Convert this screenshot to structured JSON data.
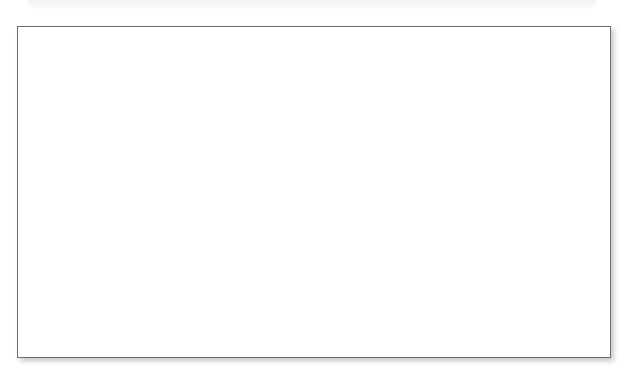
{
  "top_strip": {
    "text": ""
  },
  "figure": {
    "title": "",
    "stroke_color": "#6e6e6e",
    "dashed_color": "#9a9a9a",
    "text_color": "#111111",
    "background": "#ffffff"
  },
  "nodes": [
    {
      "id": "gp_m_left",
      "shape": "square",
      "label": "",
      "sub": "",
      "x": 81,
      "y": 65,
      "size": 32,
      "deceased": false
    },
    {
      "id": "gp_f_left",
      "shape": "circle",
      "label": "",
      "sub": "",
      "x": 256,
      "y": 64,
      "size": 32,
      "deceased": false
    },
    {
      "id": "aunt1",
      "shape": "circle",
      "label": "",
      "sub": "",
      "x": 116,
      "y": 136,
      "size": 32,
      "deceased": false
    },
    {
      "id": "aunt2",
      "shape": "circle",
      "label": "",
      "sub": "",
      "x": 158,
      "y": 136,
      "size": 32,
      "deceased": false
    },
    {
      "id": "aunt3",
      "shape": "circle",
      "label": "",
      "sub": "",
      "x": 208,
      "y": 136,
      "size": 32,
      "deceased": false
    },
    {
      "id": "partner_left",
      "shape": "square",
      "label": "",
      "sub": "",
      "x": 260,
      "y": 133,
      "size": 32,
      "deceased": false
    },
    {
      "id": "cousin_left",
      "shape": "circle",
      "label": "",
      "sub": "",
      "x": 244,
      "y": 195,
      "size": 32,
      "deceased": false
    },
    {
      "id": "gp_m_right",
      "shape": "square",
      "label": "",
      "sub": "",
      "x": 378,
      "y": 61,
      "size": 32,
      "deceased": true
    },
    {
      "id": "gp_f_right",
      "shape": "circle",
      "label": "",
      "sub": "",
      "x": 475,
      "y": 62,
      "size": 32,
      "deceased": false
    },
    {
      "id": "partner_right",
      "shape": "square",
      "label": "",
      "sub": "",
      "x": 351,
      "y": 128,
      "size": 32,
      "deceased": false
    },
    {
      "id": "aunt_right",
      "shape": "circle",
      "label": "",
      "sub": "",
      "x": 418,
      "y": 128,
      "size": 32,
      "deceased": false
    },
    {
      "id": "cousin_r_m",
      "shape": "square",
      "label": "",
      "sub": "",
      "x": 357,
      "y": 191,
      "size": 32,
      "deceased": false
    },
    {
      "id": "cousin_r_f",
      "shape": "circle",
      "label": "",
      "sub": "",
      "x": 411,
      "y": 191,
      "size": 32,
      "deceased": false
    },
    {
      "id": "bobby",
      "shape": "square",
      "label": "Bobby",
      "sub": "36",
      "x": 85,
      "y": 249,
      "size": 44,
      "deceased": false
    },
    {
      "id": "vivian",
      "shape": "circle",
      "label": "Vivian",
      "sub": "36",
      "x": 468,
      "y": 249,
      "size": 44,
      "deceased": false
    },
    {
      "id": "marcie",
      "shape": "circle",
      "label": "Marcie",
      "sub": "12",
      "x": 215,
      "y": 323,
      "size": 44,
      "deceased": false
    },
    {
      "id": "caleb",
      "shape": "square",
      "label": "Caleb",
      "sub": "3",
      "x": 346,
      "y": 320,
      "size": 44,
      "deceased": false
    }
  ],
  "annotations": [
    {
      "id": "annot-right",
      "lines": [
        "Moved into",
        "Bobby and",
        "Vivian's house."
      ],
      "x": 492,
      "y": 76,
      "align": "left"
    },
    {
      "id": "annot-left",
      "lines": [
        "Moved into Bobby",
        "and Vivian's house."
      ],
      "x": 195,
      "y": 222,
      "align": "left"
    }
  ],
  "legend": {
    "square_meaning": "male",
    "circle_meaning": "female",
    "crossed_meaning": "deceased",
    "dashed_meaning": "non-marital or cohabiting relationship",
    "solid_meaning": "marriage or descent line"
  }
}
